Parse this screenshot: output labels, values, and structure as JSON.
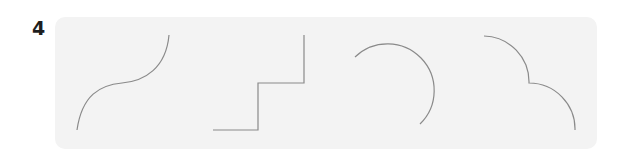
{
  "figure": {
    "label": "4",
    "panel_color": "#f3f3f3",
    "stroke_color": "#8a8a8a",
    "shapes": [
      {
        "name": "s-curve",
        "path": "M77 130 C 82 95, 100 85, 122 83 C 145 81, 166 68, 169 35"
      },
      {
        "name": "staircase",
        "path": "M213 130 L258 130 L258 83 L304 83 L304 35"
      },
      {
        "name": "arc",
        "path": "M355 57 A 46 46 0 1 1 420 124"
      },
      {
        "name": "double-arc",
        "path": "M484 36 A 46 46 0 0 1 529 83 A 46 46 0 0 1 575 130"
      }
    ]
  }
}
